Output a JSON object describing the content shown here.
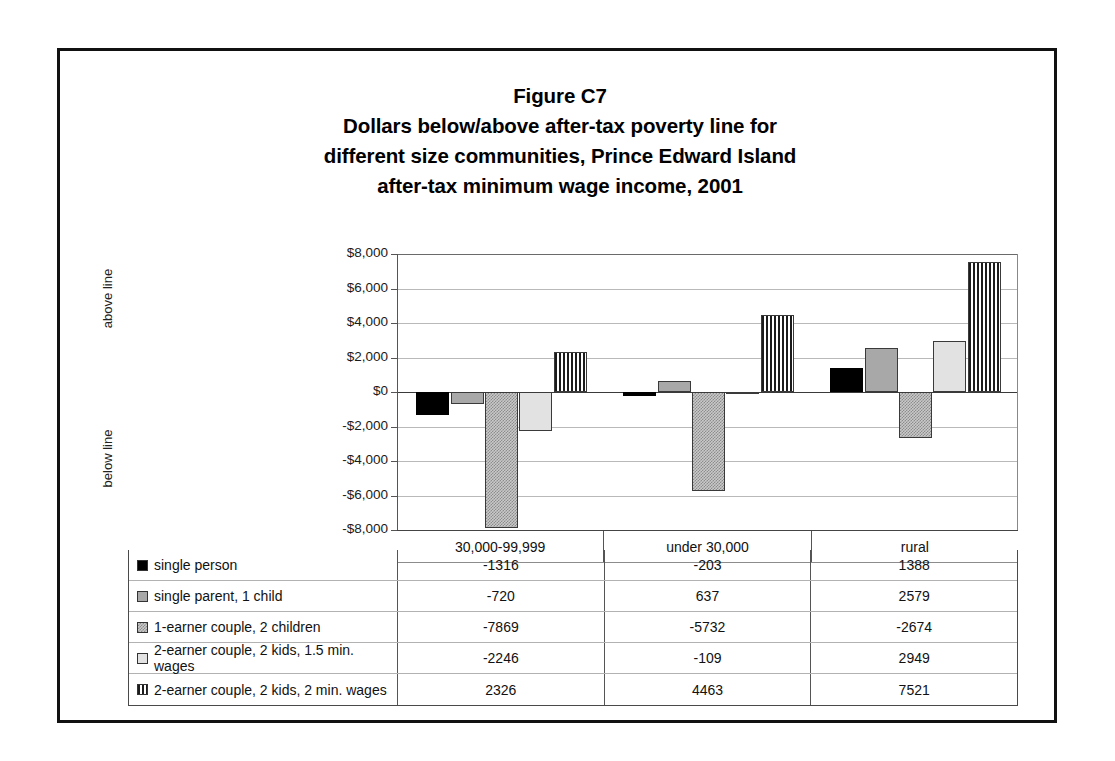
{
  "title": {
    "line1": "Figure C7",
    "line2": "Dollars below/above after-tax poverty line for",
    "line3": "different size communities, Prince Edward Island",
    "line4": "after-tax minimum wage income, 2001"
  },
  "axis": {
    "above_label": "above line",
    "below_label": "below line",
    "ytick_labels": [
      "$8,000",
      "$6,000",
      "$4,000",
      "$2,000",
      "$0",
      "-$2,000",
      "-$4,000",
      "-$6,000",
      "-$8,000"
    ]
  },
  "table": {
    "row_header_blank": "",
    "column_headers": [
      "30,000-99,999",
      "under 30,000",
      "rural"
    ],
    "rows": [
      {
        "label": "single person",
        "swatch": "solid-black",
        "values": [
          "-1316",
          "-203",
          "1388"
        ]
      },
      {
        "label": "single parent, 1 child",
        "swatch": "gray-med",
        "values": [
          "-720",
          "637",
          "2579"
        ]
      },
      {
        "label": "1-earner couple, 2 children",
        "swatch": "gray-speckle",
        "values": [
          "-7869",
          "-5732",
          "-2674"
        ]
      },
      {
        "label": "2-earner couple, 2 kids, 1.5 min. wages",
        "swatch": "gray-light",
        "values": [
          "-2246",
          "-109",
          "2949"
        ]
      },
      {
        "label": "2-earner couple, 2 kids, 2 min. wages",
        "swatch": "vstripe",
        "values": [
          "2326",
          "4463",
          "7521"
        ]
      }
    ]
  },
  "chart_data": {
    "type": "bar",
    "xlabel": "",
    "ylabel": "",
    "ylim": [
      -8000,
      8000
    ],
    "ytick_step": 2000,
    "grid": true,
    "legend_position": "table-below",
    "categories": [
      "30,000-99,999",
      "under 30,000",
      "rural"
    ],
    "series": [
      {
        "name": "single person",
        "fill": "solid-black",
        "values": [
          -1316,
          -203,
          1388
        ]
      },
      {
        "name": "single parent, 1 child",
        "fill": "gray-med",
        "values": [
          -720,
          637,
          2579
        ]
      },
      {
        "name": "1-earner couple, 2 children",
        "fill": "gray-speckle",
        "values": [
          -7869,
          -5732,
          -2674
        ]
      },
      {
        "name": "2-earner couple, 2 kids, 1.5 min. wages",
        "fill": "gray-light",
        "values": [
          -2246,
          -109,
          2949
        ]
      },
      {
        "name": "2-earner couple, 2 kids, 2 min. wages",
        "fill": "vstripe",
        "values": [
          2326,
          4463,
          7521
        ]
      }
    ]
  }
}
